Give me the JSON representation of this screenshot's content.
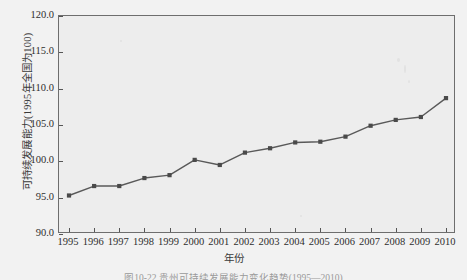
{
  "chart_data": {
    "type": "line",
    "title": "",
    "xlabel": "年份",
    "ylabel": "可持续发展能力(1995年全国为100)",
    "categories": [
      "1995",
      "1996",
      "1997",
      "1998",
      "1999",
      "2000",
      "2001",
      "2002",
      "2003",
      "2004",
      "2005",
      "2006",
      "2007",
      "2008",
      "2009",
      "2010"
    ],
    "values": [
      95.3,
      96.6,
      96.6,
      97.7,
      98.1,
      100.2,
      99.5,
      101.2,
      101.8,
      102.6,
      102.7,
      103.4,
      104.9,
      105.7,
      106.1,
      108.7
    ],
    "series": [
      {
        "name": "可持续发展能力",
        "values": [
          95.3,
          96.6,
          96.6,
          97.7,
          98.1,
          100.2,
          99.5,
          101.2,
          101.8,
          102.6,
          102.7,
          103.4,
          104.9,
          105.7,
          106.1,
          108.7
        ]
      }
    ],
    "ylim": [
      90.0,
      120.0
    ],
    "yticks": [
      "90.0",
      "95.0",
      "100.0",
      "105.0",
      "110.0",
      "115.0",
      "120.0"
    ],
    "ytick_values": [
      90.0,
      95.0,
      100.0,
      105.0,
      110.0,
      115.0,
      120.0
    ],
    "xticks": [
      "1995",
      "1996",
      "1997",
      "1998",
      "1999",
      "2000",
      "2001",
      "2002",
      "2003",
      "2004",
      "2005",
      "2006",
      "2007",
      "2008",
      "2009",
      "2010"
    ],
    "grid": false,
    "legend": "none",
    "line_color": "#595959",
    "marker_color": "#4a4a4a",
    "marker": "square",
    "plot_background": "#ededed",
    "page_background": "#f2f2f2"
  },
  "caption": {
    "text": "图10-22  贵州可持续发展能力变化趋势(1995—2010)"
  }
}
